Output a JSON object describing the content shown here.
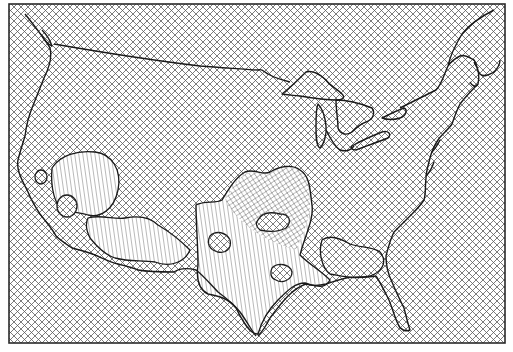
{
  "figure": {
    "type": "hatched-surface-map",
    "region": "contiguous-united-states",
    "colors": {
      "background": "#ffffff",
      "ink": "#1a1a1a",
      "hatch": "#555555"
    },
    "frame": {
      "x": 9,
      "y": 4,
      "width": 496,
      "height": 339
    },
    "hatch": {
      "spacing": 7,
      "pattern": "diagonal-crosshatch"
    },
    "regions": [
      {
        "name": "california-nevada-anomaly",
        "fill": "vertical-hatch"
      },
      {
        "name": "arizona-new-mexico-anomaly",
        "fill": "vertical-hatch"
      },
      {
        "name": "texas-oklahoma-anomaly",
        "fill": "vertical-hatch"
      },
      {
        "name": "kansas-missouri-anomaly",
        "fill": "warped-crosshatch"
      },
      {
        "name": "gulf-coast-anomaly",
        "fill": "crosshatch"
      }
    ]
  }
}
